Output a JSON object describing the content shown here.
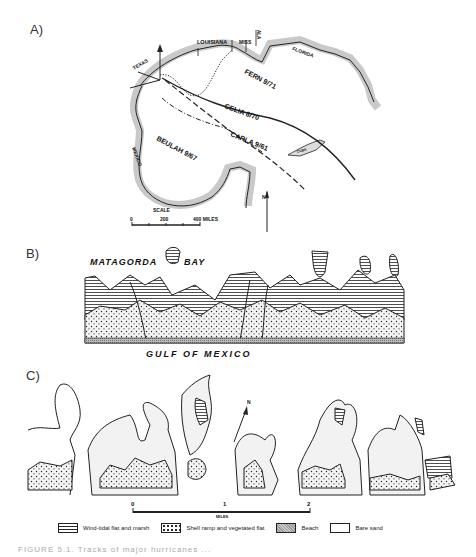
{
  "figure": {
    "caption": "FIGURE 5.1. Tracks of major hurricanes ...",
    "panels": {
      "a": {
        "label": "A)",
        "regions": {
          "texas": "TEXAS",
          "louisiana": "LOUISIANA",
          "mississippi": "MISS",
          "alabama": "ALA",
          "florida": "FLORIDA",
          "mexico": "MEXICO",
          "cuba": "CUBA"
        },
        "hurricane_tracks": [
          {
            "name": "FERN",
            "date": "9/71",
            "label": "FERN 9/71",
            "style": "dotted"
          },
          {
            "name": "CELIA",
            "date": "8/70",
            "label": "CELIA 8/70",
            "style": "solid"
          },
          {
            "name": "CARLA",
            "date": "9/61",
            "label": "CARLA 9/61",
            "style": "long-dash"
          },
          {
            "name": "BEULAH",
            "date": "9/67",
            "label": "BEULAH 9/67",
            "style": "dash-dot"
          }
        ],
        "north_arrow": "N",
        "scale": {
          "title": "SCALE",
          "ticks": [
            "0",
            "200",
            "400 MILES"
          ]
        }
      },
      "b": {
        "label": "B)",
        "bay_label_left": "MATAGORDA",
        "bay_label_right": "BAY",
        "gulf_label": "GULF OF MEXICO"
      },
      "c": {
        "label": "C)",
        "north_arrow": "N",
        "scale": {
          "ticks": [
            "0",
            "1",
            "2"
          ],
          "unit": "MILES"
        }
      }
    },
    "legend": [
      {
        "key": "marsh",
        "label": "Wind-tidal flat and marsh"
      },
      {
        "key": "shell",
        "label": "Shell ramp and vegetated flat"
      },
      {
        "key": "beach",
        "label": "Beach"
      },
      {
        "key": "bare",
        "label": "Bare sand"
      }
    ]
  }
}
